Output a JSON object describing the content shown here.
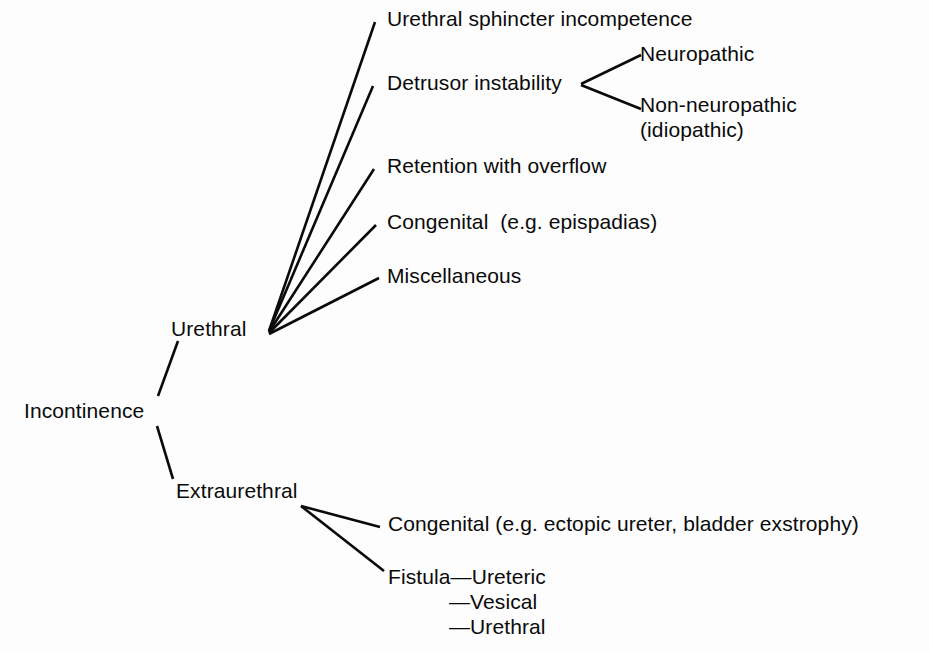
{
  "diagram": {
    "type": "tree",
    "root": "Incontinence",
    "line_color": "#0a0a0a",
    "background_color": "#fdfdfd",
    "text_color": "#0a0a0a",
    "nodes": {
      "root": "Incontinence",
      "urethral": "Urethral",
      "extraurethral": "Extraurethral",
      "urethral_children": [
        "Urethral sphincter incompetence",
        "Detrusor instability",
        "Retention with overflow",
        "Congenital  (e.g. epispadias)",
        "Miscellaneous"
      ],
      "detrusor_children": [
        "Neuropathic",
        "Non-neuropathic\n(idiopathic)"
      ],
      "extraurethral_children": [
        "Congenital (e.g. ectopic ureter, bladder exstrophy)"
      ],
      "fistula_label": "Fistula—Ureteric",
      "fistula_sub": [
        "—Vesical",
        "—Urethral"
      ]
    },
    "edges": [
      {
        "from": "Incontinence",
        "to": "Urethral"
      },
      {
        "from": "Incontinence",
        "to": "Extraurethral"
      },
      {
        "from": "Urethral",
        "to": "Urethral sphincter incompetence"
      },
      {
        "from": "Urethral",
        "to": "Detrusor instability"
      },
      {
        "from": "Urethral",
        "to": "Retention with overflow"
      },
      {
        "from": "Urethral",
        "to": "Congenital  (e.g. epispadias)"
      },
      {
        "from": "Urethral",
        "to": "Miscellaneous"
      },
      {
        "from": "Detrusor instability",
        "to": "Neuropathic"
      },
      {
        "from": "Detrusor instability",
        "to": "Non-neuropathic (idiopathic)"
      },
      {
        "from": "Extraurethral",
        "to": "Congenital (e.g. ectopic ureter, bladder exstrophy)"
      },
      {
        "from": "Extraurethral",
        "to": "Fistula—Ureteric"
      }
    ]
  }
}
